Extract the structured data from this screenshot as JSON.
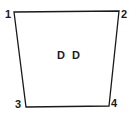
{
  "diagram": {
    "shape": "quadrilateral",
    "stroke_color": "#1a1a1a",
    "center_label": "D D",
    "vertices": [
      {
        "label": "1",
        "x": 14,
        "y": 12
      },
      {
        "label": "2",
        "x": 119,
        "y": 11
      },
      {
        "label": "4",
        "x": 109,
        "y": 106
      },
      {
        "label": "3",
        "x": 26,
        "y": 107
      }
    ]
  }
}
